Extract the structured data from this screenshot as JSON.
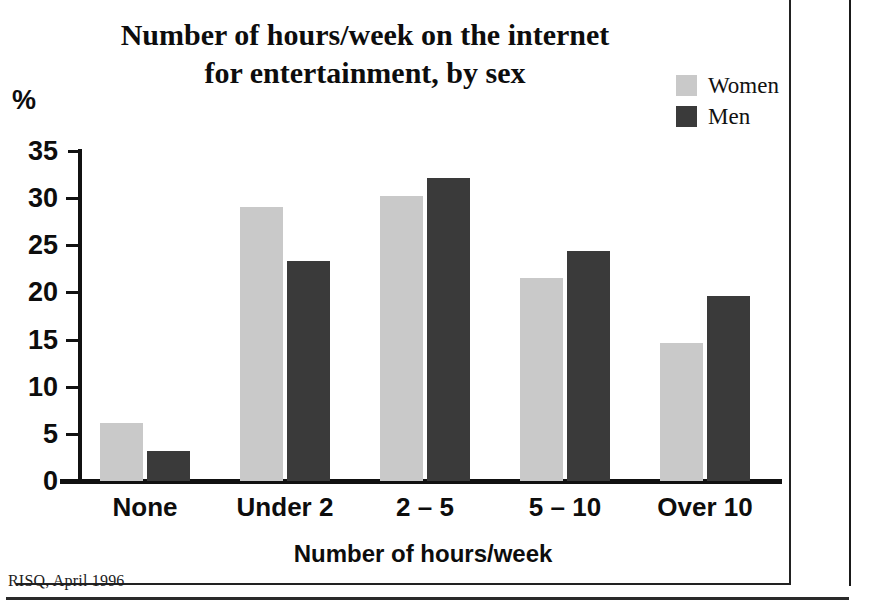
{
  "title": {
    "line1": "Number of hours/week on the internet",
    "line2": "for entertainment, by sex"
  },
  "source": "RISQ, April 1996",
  "axis": {
    "y_unit_label": "%",
    "x_title": "Number of hours/week"
  },
  "legend": {
    "items": [
      {
        "label": "Women",
        "color": "#c9c9c9"
      },
      {
        "label": "Men",
        "color": "#3a3a3a"
      }
    ]
  },
  "chart_data": {
    "type": "bar",
    "title": "Number of hours/week on the internet for entertainment, by sex",
    "xlabel": "Number of hours/week",
    "ylabel": "%",
    "ylim": [
      0,
      35
    ],
    "yticks": [
      0,
      5,
      10,
      15,
      20,
      25,
      30,
      35
    ],
    "ytick_labels": [
      "0",
      "5",
      "10",
      "15",
      "20",
      "25",
      "30",
      "35"
    ],
    "grid": false,
    "legend_position": "top-right",
    "categories": [
      "None",
      "Under 2",
      "2 – 5",
      "5 – 10",
      "Over 10"
    ],
    "series": [
      {
        "name": "Women",
        "color": "#c9c9c9",
        "values": [
          6.2,
          29.1,
          30.2,
          21.5,
          14.6
        ]
      },
      {
        "name": "Men",
        "color": "#3a3a3a",
        "values": [
          3.2,
          23.3,
          32.1,
          24.4,
          19.6
        ]
      }
    ]
  }
}
